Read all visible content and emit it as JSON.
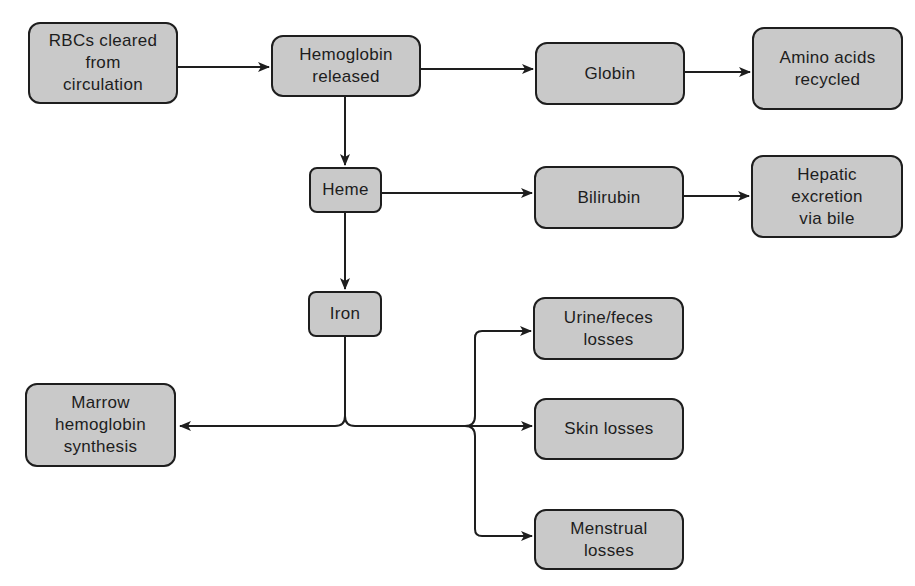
{
  "diagram": {
    "type": "flowchart",
    "title": "",
    "colors": {
      "node_fill": "#c9c9c9",
      "node_border": "#1e1e1e",
      "edge": "#1e1e1e",
      "text": "#1d1d1d"
    },
    "nodes": {
      "rbcs": {
        "label": "RBCs cleared\nfrom\ncirculation"
      },
      "hemoglobin": {
        "label": "Hemoglobin\nreleased"
      },
      "globin": {
        "label": "Globin"
      },
      "amino": {
        "label": "Amino acids\nrecycled"
      },
      "heme": {
        "label": "Heme"
      },
      "bilirubin": {
        "label": "Bilirubin"
      },
      "hepatic": {
        "label": "Hepatic\nexcretion\nvia bile"
      },
      "iron": {
        "label": "Iron"
      },
      "urine": {
        "label": "Urine/feces\nlosses"
      },
      "skin": {
        "label": "Skin losses"
      },
      "menstrual": {
        "label": "Menstrual\nlosses"
      },
      "marrow": {
        "label": "Marrow\nhemoglobin\nsynthesis"
      }
    },
    "edges": [
      {
        "from": "rbcs",
        "to": "hemoglobin"
      },
      {
        "from": "hemoglobin",
        "to": "globin"
      },
      {
        "from": "globin",
        "to": "amino"
      },
      {
        "from": "hemoglobin",
        "to": "heme"
      },
      {
        "from": "heme",
        "to": "bilirubin"
      },
      {
        "from": "bilirubin",
        "to": "hepatic"
      },
      {
        "from": "heme",
        "to": "iron"
      },
      {
        "from": "iron",
        "to": "marrow"
      },
      {
        "from": "iron",
        "to": "urine"
      },
      {
        "from": "iron",
        "to": "skin"
      },
      {
        "from": "iron",
        "to": "menstrual"
      }
    ]
  }
}
